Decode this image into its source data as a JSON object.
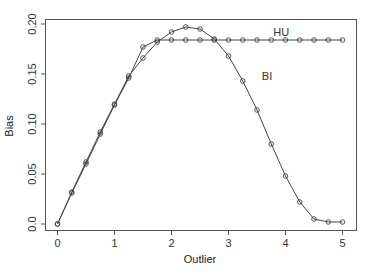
{
  "chart_data": {
    "type": "line",
    "title": "",
    "xlabel": "Outlier",
    "ylabel": "Bias",
    "xlim": [
      0,
      5
    ],
    "ylim": [
      0,
      0.2
    ],
    "xticks": [
      0,
      1,
      2,
      3,
      4,
      5
    ],
    "xtick_labels": [
      "0",
      "1",
      "2",
      "3",
      "4",
      "5"
    ],
    "yticks": [
      0,
      0.05,
      0.1,
      0.15,
      0.2
    ],
    "ytick_labels": [
      "0.0",
      "0.05",
      "0.10",
      "0.15",
      "0.20"
    ],
    "grid": false,
    "legend": "none (inline labels)",
    "marker": "open-circle",
    "x": [
      0,
      0.25,
      0.5,
      0.75,
      1.0,
      1.25,
      1.5,
      1.75,
      2.0,
      2.25,
      2.5,
      2.75,
      3.0,
      3.25,
      3.5,
      3.75,
      4.0,
      4.25,
      4.5,
      4.75,
      5.0
    ],
    "series": [
      {
        "name": "HU",
        "label_pos": [
          3.75,
          0.192
        ],
        "values": [
          0.0,
          0.031,
          0.06,
          0.09,
          0.119,
          0.146,
          0.177,
          0.184,
          0.184,
          0.184,
          0.184,
          0.184,
          0.184,
          0.184,
          0.184,
          0.184,
          0.184,
          0.184,
          0.184,
          0.184,
          0.184
        ]
      },
      {
        "name": "BI",
        "label_pos": [
          3.5,
          0.148
        ],
        "values": [
          0.0,
          0.032,
          0.062,
          0.092,
          0.12,
          0.148,
          0.166,
          0.182,
          0.192,
          0.197,
          0.195,
          0.185,
          0.168,
          0.143,
          0.114,
          0.08,
          0.048,
          0.022,
          0.005,
          0.002,
          0.002
        ]
      }
    ]
  }
}
